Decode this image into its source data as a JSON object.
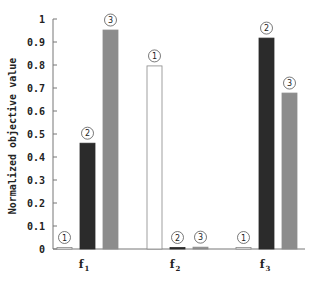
{
  "chart_data": {
    "type": "bar",
    "title": "",
    "xlabel": "",
    "ylabel": "Normalized objective value",
    "ylim": [
      0,
      1
    ],
    "yticks": [
      "0",
      "0.1",
      "0.2",
      "0.3",
      "0.4",
      "0.5",
      "0.6",
      "0.7",
      "0.8",
      "0.9",
      "1"
    ],
    "categories": [
      "f1",
      "f2",
      "f3"
    ],
    "category_labels": [
      {
        "main": "f",
        "sub": "1"
      },
      {
        "main": "f",
        "sub": "2"
      },
      {
        "main": "f",
        "sub": "3"
      }
    ],
    "series": [
      {
        "name": "1",
        "marker": "①",
        "color": "#ffffff",
        "values": [
          0.005,
          0.796,
          0.005
        ]
      },
      {
        "name": "2",
        "marker": "②",
        "color": "#2b2b2b",
        "values": [
          0.46,
          0.005,
          0.917
        ]
      },
      {
        "name": "3",
        "marker": "③",
        "color": "#8c8c8c",
        "values": [
          0.952,
          0.008,
          0.678
        ]
      }
    ],
    "grid": false,
    "legend": "none (series identified by circled numbers above bars)"
  }
}
